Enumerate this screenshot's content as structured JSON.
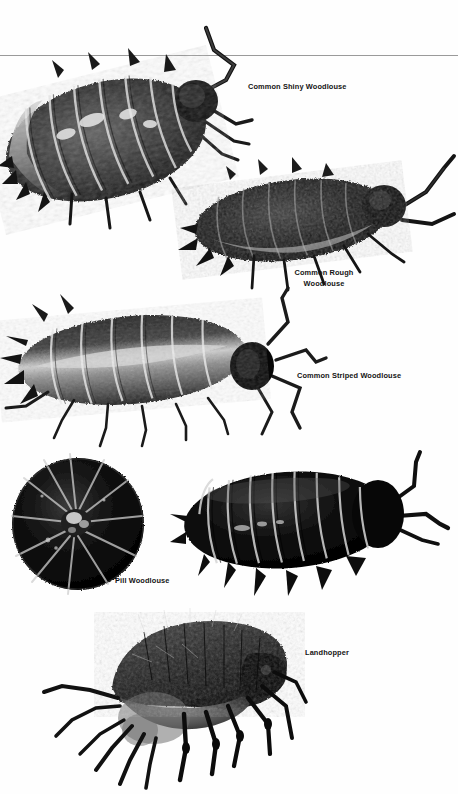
{
  "page": {
    "width": 458,
    "height": 794,
    "background": "#ffffff",
    "divider_color": "#9a9a9a",
    "caption_color": "#141414",
    "type": "field-guide photographic plate"
  },
  "divider": {
    "name": "horizontal-rule",
    "y": 55
  },
  "specimens": [
    {
      "id": "common-shiny-woodlouse",
      "label": "Common Shiny Woodlouse",
      "label_x": 248,
      "label_y": 82,
      "label_align": "left",
      "tone": "mottled grey and black",
      "orientation": "head to the upper right"
    },
    {
      "id": "common-rough-woodlouse",
      "label": "Common Rough\nWoodlouse",
      "label_x": 324,
      "label_y": 268,
      "label_align": "center",
      "tone": "very dark, rough textured",
      "orientation": "head to the right"
    },
    {
      "id": "common-striped-woodlouse",
      "label": "Common Striped Woodlouse",
      "label_x": 297,
      "label_y": 371,
      "label_align": "left",
      "tone": "dark with pale median stripe",
      "orientation": "head to the right"
    },
    {
      "id": "pill-woodlouse-rolled",
      "label": "Pill Woodlouse",
      "label_x": 115,
      "label_y": 576,
      "label_align": "left",
      "tone": "glossy black sphere",
      "orientation": "rolled into a ball"
    },
    {
      "id": "pill-woodlouse-extended",
      "label": "",
      "tone": "glossy black, strongly segmented",
      "orientation": "head to the right"
    },
    {
      "id": "landhopper",
      "label": "Landhopper",
      "label_x": 305,
      "label_y": 648,
      "label_align": "left",
      "tone": "dark grey amphipod",
      "orientation": "curved body, head to the right"
    }
  ]
}
